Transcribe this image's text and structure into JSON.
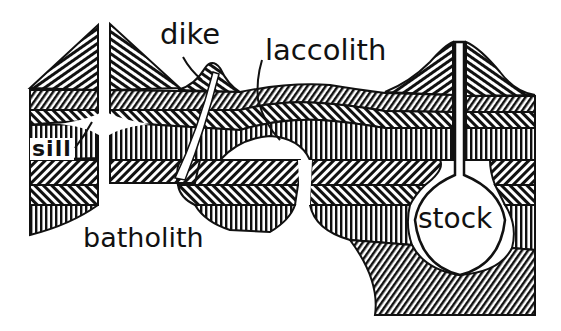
{
  "diagram": {
    "labels": {
      "dike": "dike",
      "laccolith": "laccolith",
      "sill": "sill",
      "batholith": "batholith",
      "stock": "stock"
    },
    "colors": {
      "ink": "#111111",
      "paper": "#ffffff"
    },
    "layers": [
      {
        "name": "top-hatch-diagonal-fine",
        "pattern": "diagonal-right"
      },
      {
        "name": "upper-hatch-diagonal-left",
        "pattern": "diagonal-left"
      },
      {
        "name": "middle-vertical",
        "pattern": "vertical"
      },
      {
        "name": "lower-hatch-diagonal-right",
        "pattern": "diagonal-right"
      },
      {
        "name": "lower-hatch-diagonal-left",
        "pattern": "diagonal-left"
      },
      {
        "name": "bottom-vertical",
        "pattern": "vertical"
      }
    ],
    "features": [
      "dike",
      "laccolith",
      "sill",
      "batholith",
      "stock"
    ]
  }
}
